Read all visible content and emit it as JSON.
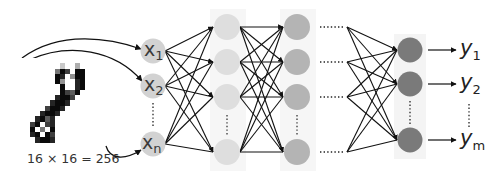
{
  "input_image": {
    "caption": "16 × 16 = 256",
    "rows": [
      "................",
      "........2..3....",
      ".......597.99...",
      ".......98.499...",
      ".......94..89...",
      "........9..89...",
      "........9769....",
      ".......8997.....",
      "......8998......",
      ".....7998.......",
      "....8998........",
      "...8968.........",
      "..79.78.........",
      "..9.5.9.........",
      "..89.97.........",
      "...8998........."
    ]
  },
  "layers": {
    "input": {
      "labels": [
        "x",
        "x",
        "x"
      ],
      "subscripts": [
        "1",
        "2",
        "n"
      ],
      "color": "#d2d2d2"
    },
    "hidden1": {
      "color": "#dedede"
    },
    "hidden2": {
      "color": "#b4b4b4"
    },
    "output": {
      "color": "#7a7a7a"
    }
  },
  "outputs": {
    "labels": [
      "y",
      "y",
      "y"
    ],
    "subscripts": [
      "1",
      "2",
      "m"
    ]
  }
}
